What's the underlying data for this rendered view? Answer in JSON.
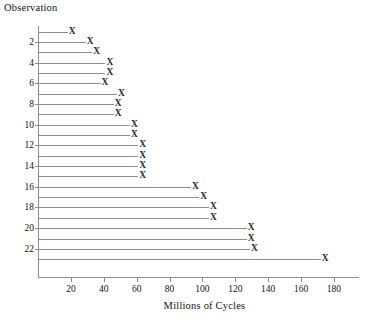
{
  "chart_data": {
    "type": "bar",
    "title": "",
    "ylabel": "Observation",
    "xlabel": "Millions of Cycles",
    "grid": false,
    "legend": "none",
    "xlim": [
      0,
      190
    ],
    "ylim": [
      0,
      24
    ],
    "x_ticks": [
      20,
      40,
      60,
      80,
      100,
      120,
      140,
      160,
      180
    ],
    "y_ticks": [
      2,
      4,
      6,
      8,
      10,
      12,
      14,
      16,
      18,
      20,
      22
    ],
    "marker": "X",
    "orientation": "horizontal",
    "categories": [
      1,
      2,
      3,
      4,
      5,
      6,
      7,
      8,
      9,
      10,
      11,
      12,
      13,
      14,
      15,
      16,
      17,
      18,
      19,
      20,
      21,
      22,
      23
    ],
    "values": [
      19,
      30,
      34,
      42,
      42,
      39,
      49,
      47,
      47,
      57,
      57,
      62,
      62,
      62,
      62,
      94,
      99,
      105,
      105,
      128,
      128,
      130,
      173
    ]
  },
  "caption": {
    "text": ""
  }
}
